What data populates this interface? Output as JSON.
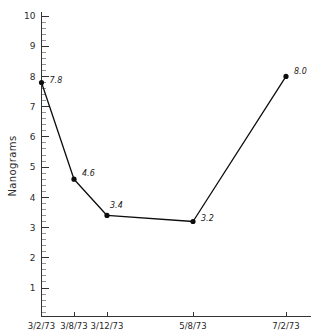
{
  "chart_data": {
    "type": "line",
    "title": "",
    "xlabel": "",
    "ylabel": "Nanograms",
    "categories": [
      "3/2/73",
      "3/8/73",
      "3/12/73",
      "5/8/73",
      "7/2/73"
    ],
    "values": [
      7.8,
      4.6,
      3.4,
      3.2,
      8.0
    ],
    "point_labels": [
      "7.8",
      "4.6",
      "3.4",
      "3.2",
      "8.0"
    ],
    "ylim": [
      0,
      10.4
    ],
    "ytick_labels": [
      "1",
      "2",
      "3",
      "4",
      "5",
      "6",
      "7",
      "8",
      "9",
      "10"
    ],
    "ytick_values": [
      1,
      2,
      3,
      4,
      5,
      6,
      7,
      8,
      9,
      10
    ],
    "yminor_step": 0.2,
    "grid": false,
    "legend": null,
    "series": [
      {
        "name": "Nanograms",
        "values": [
          7.8,
          4.6,
          3.4,
          3.2,
          8.0
        ],
        "color": "#0d0d0d",
        "marker": "circle"
      }
    ],
    "x_positions": [
      0,
      1,
      2,
      3,
      4
    ],
    "x_axis_fractions": [
      0.0,
      0.135,
      0.27,
      0.62,
      1.0
    ],
    "colors": {
      "line": "#0d0d0d",
      "marker": "#0d0d0d",
      "axis": "#333333",
      "minor_tick": "#7a7a7a",
      "text": "#1a1a1a",
      "background": "#ffffff"
    }
  }
}
